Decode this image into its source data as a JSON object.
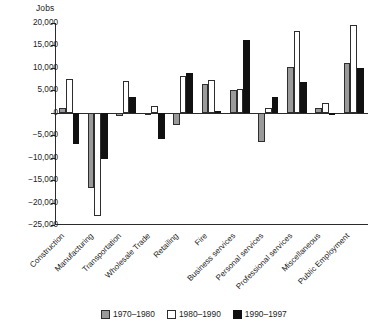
{
  "chart_data": {
    "type": "bar",
    "title": "",
    "ylabel": "Jobs",
    "xlabel": "",
    "ylim": [
      -25000,
      20000
    ],
    "ytick_values": [
      20000,
      15000,
      10000,
      5000,
      0,
      -5000,
      -10000,
      -15000,
      -20000,
      -25000
    ],
    "ytick_labels": [
      "20,000",
      "15,000",
      "10,000",
      "5,000",
      "0",
      "−5,000",
      "−10,000",
      "−15,000",
      "−20,000",
      "−25,000"
    ],
    "grid": false,
    "legend_position": "bottom",
    "categories": [
      "Construction",
      "Manufacturing",
      "Transportation",
      "Wholesale Trade",
      "Retailing",
      "Fire",
      "Business services",
      "Personal services",
      "Professional services",
      "Miscellaneous",
      "Public Employment"
    ],
    "series": [
      {
        "name": "1970–1980",
        "color": "#9a9a9a",
        "values": [
          1000,
          -16800,
          -700,
          -400,
          -2800,
          6500,
          5000,
          -6500,
          10200,
          1100,
          11000
        ]
      },
      {
        "name": "1980–1990",
        "color": "#ffffff",
        "values": [
          7500,
          -23000,
          7000,
          1500,
          8200,
          7300,
          5200,
          1000,
          18200,
          2200,
          19500
        ]
      },
      {
        "name": "1990–1997",
        "color": "#111111",
        "values": [
          -7000,
          -10200,
          3500,
          -5800,
          8800,
          300,
          16300,
          3500,
          6800,
          -400,
          10000
        ]
      }
    ]
  },
  "legend": {
    "items": [
      {
        "label": "1970–1980",
        "swatch": "gray-swatch"
      },
      {
        "label": "1980–1990",
        "swatch": "white-swatch"
      },
      {
        "label": "1990–1997",
        "swatch": "black-swatch"
      }
    ]
  }
}
